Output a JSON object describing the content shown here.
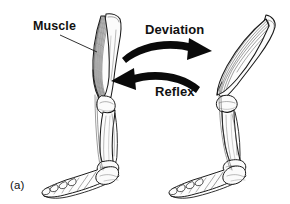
{
  "figure": {
    "panel_label": "(a)",
    "background_color": "#ffffff",
    "ink_color": "#111111",
    "width": 290,
    "height": 204,
    "caption_labels": {
      "muscle": "Muscle",
      "deviation": "Deviation",
      "reflex": "Reflex"
    },
    "annotations": [
      {
        "name": "muscle",
        "text": "Muscle",
        "target": "left-limb-muscle-belly",
        "leader_line": true
      },
      {
        "name": "deviation",
        "text": "Deviation",
        "arrow_direction": "right",
        "from": "left-limb",
        "to": "right-limb"
      },
      {
        "name": "reflex",
        "text": "Reflex",
        "arrow_direction": "left",
        "from": "right-limb",
        "to": "left-limb"
      }
    ],
    "figures": [
      {
        "name": "left-limb",
        "state": "upright",
        "description": "Extended hind limb skeleton with relaxed elongated muscle, foot flat on ground"
      },
      {
        "name": "right-limb",
        "state": "deviated",
        "description": "Flexed hind limb skeleton with contracted bulging muscle, leg angled forward"
      }
    ]
  }
}
